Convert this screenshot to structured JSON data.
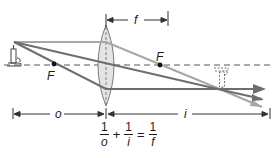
{
  "diagram": {
    "type": "thin converging lens ray diagram",
    "colors": {
      "axis": "#555555",
      "ray_light": "#a6a6a6",
      "ray_dark": "#6e6e6e",
      "lens_fill": "#e4e4e4",
      "lens_stroke": "#7a7a7a",
      "text": "#1a1a1a"
    },
    "labels": {
      "focal_point_left": "F",
      "focal_point_right": "F",
      "focal_length": "f",
      "object_distance": "o",
      "image_distance": "i"
    },
    "formula": {
      "term1": {
        "numerator": "1",
        "denominator": "o"
      },
      "plus": "+",
      "term2": {
        "numerator": "1",
        "denominator": "i"
      },
      "equals": "=",
      "term3": {
        "numerator": "1",
        "denominator": "f"
      }
    },
    "elements": {
      "object": "candle (upright)",
      "image": "candle (inverted, dashed outline)",
      "lens": "double-convex lens"
    }
  }
}
